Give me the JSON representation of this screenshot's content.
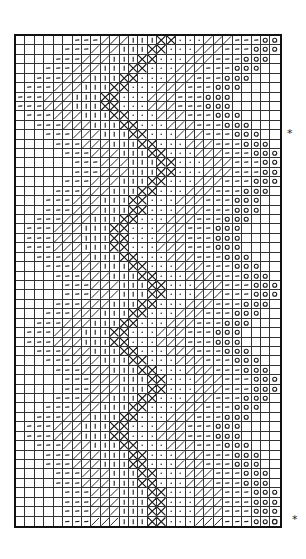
{
  "chart_data": {
    "type": "table",
    "title": "",
    "columns": 28,
    "rows": 52,
    "cell_px": 9.43,
    "band_sequence": [
      {
        "symbol": "dash",
        "count": 3
      },
      {
        "symbol": "slash",
        "count": 3
      },
      {
        "symbol": "bar",
        "count": 3
      },
      {
        "symbol": "cross",
        "count": 2
      },
      {
        "symbol": "dot",
        "count": 3
      },
      {
        "symbol": "slash",
        "count": 3
      },
      {
        "symbol": "dash",
        "count": 3
      },
      {
        "symbol": "circle",
        "count": 3
      }
    ],
    "row_band_start": [
      6,
      5,
      4,
      3,
      2,
      1,
      0,
      0,
      1,
      2,
      3,
      4,
      5,
      6,
      6,
      5,
      4,
      3,
      3,
      2,
      1,
      1,
      1,
      2,
      3,
      4,
      5,
      5,
      4,
      3,
      2,
      1,
      1,
      2,
      3,
      4,
      5,
      5,
      4,
      3,
      2,
      1,
      1,
      2,
      3,
      3,
      4,
      4,
      5,
      5,
      5,
      5
    ],
    "legend": {
      "dash": "horizontal dash stitch",
      "slash": "diagonal slash stitch",
      "bar": "vertical bar stitch",
      "cross": "X cross stitch",
      "dot": "dot stitch",
      "circle": "open circle stitch",
      "empty": "blank square"
    }
  },
  "annotations": [
    {
      "text": "*",
      "x": 288,
      "y": 133
    },
    {
      "text": "*",
      "x": 293,
      "y": 519
    }
  ],
  "colors": {
    "ink": "#1a1a1a",
    "paper": "#ffffff"
  }
}
